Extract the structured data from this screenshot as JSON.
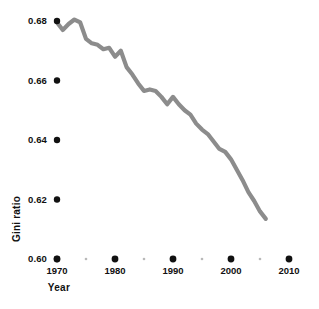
{
  "chart_data": {
    "type": "line",
    "title": "",
    "subtitle": "",
    "xlabel": "Year",
    "ylabel": "Gini ratio",
    "xlim": [
      1968,
      2012
    ],
    "ylim": [
      0.6,
      0.685
    ],
    "grid": false,
    "legend": null,
    "line_color": "#8c8c8c",
    "marker_color": "#111111",
    "x_major_ticks": [
      1970,
      1980,
      1990,
      2000,
      2010
    ],
    "x_major_tick_labels": [
      "1970",
      "1980",
      "1990",
      "2000",
      "2010"
    ],
    "x_minor_ticks": [
      1975,
      1985,
      1995,
      2005
    ],
    "y_ticks": [
      0.68,
      0.66,
      0.64,
      0.62,
      0.6
    ],
    "y_tick_labels": [
      "0.68",
      "0.66",
      "0.64",
      "0.62",
      "0.60"
    ],
    "series": [
      {
        "name": "Gini ratio",
        "x": [
          1970,
          1971,
          1972,
          1973,
          1974,
          1975,
          1976,
          1977,
          1978,
          1979,
          1980,
          1981,
          1982,
          1983,
          1984,
          1985,
          1986,
          1987,
          1988,
          1989,
          1990,
          1991,
          1992,
          1993,
          1994,
          1995,
          1996,
          1997,
          1998,
          1999,
          2000,
          2001,
          2002,
          2003,
          2004,
          2005,
          2006
        ],
        "values": [
          0.6795,
          0.677,
          0.679,
          0.6805,
          0.6795,
          0.674,
          0.6725,
          0.672,
          0.6705,
          0.671,
          0.668,
          0.67,
          0.6645,
          0.662,
          0.659,
          0.6565,
          0.657,
          0.6565,
          0.6545,
          0.652,
          0.6545,
          0.652,
          0.65,
          0.6485,
          0.6455,
          0.6435,
          0.642,
          0.6395,
          0.637,
          0.636,
          0.6335,
          0.63,
          0.6265,
          0.6225,
          0.6195,
          0.616,
          0.6135
        ]
      }
    ]
  },
  "axes": {
    "ylabel_text": "Gini ratio",
    "xlabel_text": "Year"
  }
}
